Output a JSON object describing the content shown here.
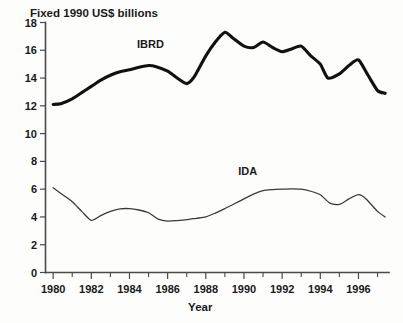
{
  "chart_data": {
    "type": "line",
    "title": "Fixed 1990 US$ billions",
    "xlabel": "Year",
    "ylabel": "",
    "xlim": [
      1979.6,
      1997.6
    ],
    "ylim": [
      0,
      18
    ],
    "grid": false,
    "legend_position": "inline-annotations",
    "x_ticks_major": [
      1980,
      1982,
      1984,
      1986,
      1988,
      1990,
      1992,
      1994,
      1996
    ],
    "x_ticks_minor": [
      1981,
      1983,
      1985,
      1987,
      1989,
      1991,
      1993,
      1995,
      1997
    ],
    "x_tick_labels": [
      "1980",
      "1982",
      "1984",
      "1986",
      "1988",
      "1990",
      "1992",
      "1994",
      "1996"
    ],
    "y_ticks": [
      0,
      2,
      4,
      6,
      8,
      10,
      12,
      14,
      16,
      18
    ],
    "y_tick_labels": [
      "0",
      "2",
      "4",
      "6",
      "8",
      "10",
      "12",
      "14",
      "16",
      "18"
    ],
    "x": [
      1980,
      1981,
      1982,
      1983,
      1984,
      1985,
      1986,
      1987,
      1988,
      1989,
      1990,
      1991,
      1992,
      1993,
      1994,
      1995,
      1996,
      1997
    ],
    "series": [
      {
        "name": "IBRD",
        "label": "IBRD",
        "color": "#111111",
        "label_x": 1985.1,
        "label_y": 16.15,
        "values": [
          12.1,
          12.5,
          13.4,
          14.2,
          14.6,
          14.9,
          14.5,
          13.6,
          15.6,
          17.3,
          16.3,
          16.6,
          15.9,
          16.3,
          15.0,
          14.3,
          15.3,
          12.9
        ]
      },
      {
        "name": "IDA",
        "label": "IDA",
        "color": "#3a3a3a",
        "label_x": 1990.2,
        "label_y": 7.0,
        "values": [
          6.1,
          5.1,
          3.75,
          4.4,
          4.6,
          4.3,
          3.7,
          3.8,
          4.0,
          4.6,
          5.3,
          5.9,
          6.0,
          6.0,
          5.6,
          4.9,
          5.6,
          4.0
        ]
      }
    ],
    "series_detail_points": {
      "IBRD": [
        [
          1980.0,
          12.1
        ],
        [
          1980.4,
          12.15
        ],
        [
          1981.0,
          12.5
        ],
        [
          1981.5,
          12.95
        ],
        [
          1982.0,
          13.4
        ],
        [
          1982.5,
          13.85
        ],
        [
          1983.0,
          14.2
        ],
        [
          1983.5,
          14.45
        ],
        [
          1984.0,
          14.6
        ],
        [
          1984.5,
          14.78
        ],
        [
          1985.0,
          14.9
        ],
        [
          1985.4,
          14.82
        ],
        [
          1986.0,
          14.5
        ],
        [
          1986.5,
          14.0
        ],
        [
          1987.0,
          13.6
        ],
        [
          1987.4,
          14.1
        ],
        [
          1988.0,
          15.6
        ],
        [
          1988.5,
          16.6
        ],
        [
          1989.0,
          17.3
        ],
        [
          1989.4,
          16.9
        ],
        [
          1990.0,
          16.3
        ],
        [
          1990.5,
          16.2
        ],
        [
          1991.0,
          16.6
        ],
        [
          1991.5,
          16.2
        ],
        [
          1992.0,
          15.9
        ],
        [
          1992.5,
          16.1
        ],
        [
          1993.0,
          16.3
        ],
        [
          1993.5,
          15.6
        ],
        [
          1994.0,
          15.0
        ],
        [
          1994.4,
          14.0
        ],
        [
          1995.0,
          14.3
        ],
        [
          1995.5,
          14.9
        ],
        [
          1996.0,
          15.3
        ],
        [
          1996.5,
          14.2
        ],
        [
          1997.0,
          13.1
        ],
        [
          1997.4,
          12.9
        ]
      ],
      "IDA": [
        [
          1980.0,
          6.1
        ],
        [
          1980.5,
          5.6
        ],
        [
          1981.0,
          5.1
        ],
        [
          1981.5,
          4.4
        ],
        [
          1982.0,
          3.75
        ],
        [
          1982.5,
          4.1
        ],
        [
          1983.0,
          4.4
        ],
        [
          1983.5,
          4.58
        ],
        [
          1984.0,
          4.6
        ],
        [
          1984.5,
          4.5
        ],
        [
          1985.0,
          4.3
        ],
        [
          1985.5,
          3.85
        ],
        [
          1986.0,
          3.7
        ],
        [
          1986.5,
          3.74
        ],
        [
          1987.0,
          3.8
        ],
        [
          1987.5,
          3.9
        ],
        [
          1988.0,
          4.0
        ],
        [
          1988.5,
          4.28
        ],
        [
          1989.0,
          4.6
        ],
        [
          1989.5,
          4.95
        ],
        [
          1990.0,
          5.3
        ],
        [
          1990.5,
          5.65
        ],
        [
          1991.0,
          5.9
        ],
        [
          1991.5,
          5.97
        ],
        [
          1992.0,
          6.0
        ],
        [
          1992.5,
          6.02
        ],
        [
          1993.0,
          6.0
        ],
        [
          1993.5,
          5.85
        ],
        [
          1994.0,
          5.6
        ],
        [
          1994.5,
          5.0
        ],
        [
          1995.0,
          4.9
        ],
        [
          1995.5,
          5.3
        ],
        [
          1996.0,
          5.6
        ],
        [
          1996.4,
          5.3
        ],
        [
          1997.0,
          4.4
        ],
        [
          1997.4,
          4.0
        ]
      ]
    }
  }
}
